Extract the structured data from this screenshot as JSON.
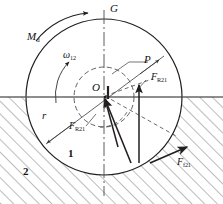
{
  "figure": {
    "width": 223,
    "height": 204,
    "background": "#ffffff",
    "line_color": "#231f20",
    "hatch_color": "#555555"
  },
  "labels": {
    "driving_moment": {
      "base": "M",
      "sub": "d"
    },
    "angular_velocity": {
      "base": "ω",
      "sub": "12"
    },
    "vertical_axis": {
      "base": "G",
      "sub": ""
    },
    "contact_point": {
      "base": "P",
      "sub": ""
    },
    "center": {
      "base": "O",
      "sub": ""
    },
    "reaction_force": {
      "base": "F",
      "sub": "R21"
    },
    "reaction_force_component": {
      "base": "F",
      "sub": "R21"
    },
    "friction_force": {
      "base": "F",
      "sub": "f21"
    },
    "radius": {
      "base": "r",
      "sub": ""
    },
    "body_one": {
      "base": "1",
      "sub": ""
    },
    "body_two": {
      "base": "2",
      "sub": ""
    }
  },
  "geometry": {
    "center": {
      "x": 104,
      "y": 97
    },
    "wheel_radius": 78,
    "friction_circle_radius": 30,
    "ground_line_y": 97,
    "contact_point": {
      "x": 139,
      "y": 153
    },
    "arrow_tip_reaction": {
      "x": 139,
      "y": 85
    },
    "rotation_sense": "clockwise"
  }
}
